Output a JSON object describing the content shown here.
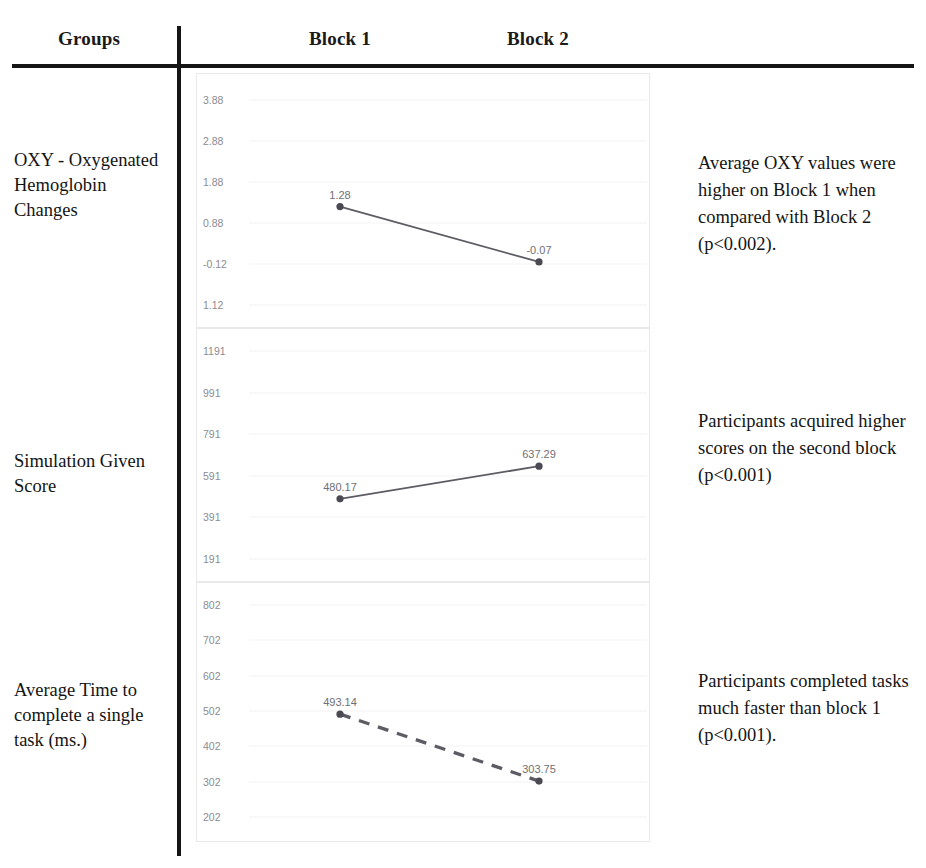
{
  "table": {
    "columns": {
      "groups": "Groups",
      "block1": "Block 1",
      "block2": "Block 2"
    },
    "rows": [
      {
        "label": "OXY - Oxygenated Hemoglobin Changes",
        "note": "Average OXY values were higher on Block 1 when compared with Block 2 (p<0.002)."
      },
      {
        "label": "Simulation Given Score",
        "note": "Participants acquired higher scores on the second block (p<0.001)"
      },
      {
        "label": "Average Time to complete a single task (ms.)",
        "note": "Participants completed tasks much faster than block 1 (p<0.001)."
      }
    ]
  },
  "style": {
    "line_color": "#5c5c64",
    "marker_color": "#4a4a52",
    "tick_color": "#8b8b92",
    "grid_color": "#f4f4f6",
    "rule_color": "#151515"
  },
  "chart_data": [
    {
      "type": "line",
      "title": "OXY - Oxygenated Hemoglobin Changes",
      "xlabel": "",
      "ylabel": "",
      "categories": [
        "Block 1",
        "Block 2"
      ],
      "values": [
        1.28,
        -0.07
      ],
      "point_labels": [
        "1.28",
        "-0.07"
      ],
      "yticks": [
        "3.88",
        "2.88",
        "1.88",
        "0.88",
        "-0.12",
        "1.12"
      ],
      "ytick_values": [
        3.88,
        2.88,
        1.88,
        0.88,
        -0.12,
        -1.12
      ],
      "ylim": [
        -1.12,
        3.88
      ],
      "linestyle": "solid",
      "grid": true,
      "legend": "none"
    },
    {
      "type": "line",
      "title": "Simulation Given Score",
      "xlabel": "",
      "ylabel": "",
      "categories": [
        "Block 1",
        "Block 2"
      ],
      "values": [
        480.17,
        637.29
      ],
      "point_labels": [
        "480.17",
        "637.29"
      ],
      "yticks": [
        "1191",
        "991",
        "791",
        "591",
        "391",
        "191"
      ],
      "ytick_values": [
        1191,
        991,
        791,
        591,
        391,
        191
      ],
      "ylim": [
        191,
        1191
      ],
      "linestyle": "solid",
      "grid": true,
      "legend": "none"
    },
    {
      "type": "line",
      "title": "Average Time to complete a single task (ms.)",
      "xlabel": "",
      "ylabel": "",
      "categories": [
        "Block 1",
        "Block 2"
      ],
      "values": [
        493.14,
        303.75
      ],
      "point_labels": [
        "493.14",
        "303.75"
      ],
      "yticks": [
        "802",
        "702",
        "602",
        "502",
        "402",
        "302",
        "202"
      ],
      "ytick_values": [
        802,
        702,
        602,
        502,
        402,
        302,
        202
      ],
      "ylim": [
        202,
        802
      ],
      "linestyle": "dashed",
      "grid": true,
      "legend": "none"
    }
  ]
}
